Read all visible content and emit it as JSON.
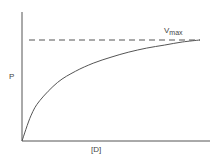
{
  "chart_data": {
    "type": "line",
    "title": "",
    "xlabel": "[D]",
    "ylabel": "P",
    "grid": false,
    "legend": null,
    "ticks": {
      "x": [],
      "y": []
    },
    "series": [
      {
        "name": "saturation curve",
        "style": "solid",
        "x": [
          0,
          0.05,
          0.1,
          0.2,
          0.3,
          0.4,
          0.5,
          0.6,
          0.7,
          0.8,
          0.9,
          1.0
        ],
        "y": [
          0,
          0.25,
          0.4,
          0.58,
          0.69,
          0.77,
          0.83,
          0.88,
          0.92,
          0.95,
          0.98,
          1.0
        ]
      },
      {
        "name": "Vmax asymptote",
        "style": "dashed",
        "x": [
          0.03,
          1.0
        ],
        "y": [
          1.0,
          1.0
        ]
      }
    ],
    "annotations": [
      {
        "text": "Vmax",
        "base": "V",
        "subscript": "max",
        "position": "above dashed line, right end"
      }
    ]
  },
  "labels": {
    "y_axis": "P",
    "x_axis": "[D]",
    "vmax_base": "V",
    "vmax_sub": "max"
  },
  "colors": {
    "line": "#555555",
    "text": "#444444",
    "background": "#ffffff"
  }
}
